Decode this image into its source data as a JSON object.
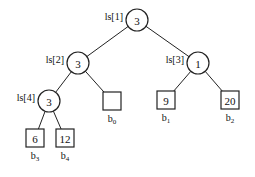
{
  "diagram": {
    "type": "loser-tree",
    "internal_nodes": [
      {
        "id": "n1",
        "label": "ls[1]",
        "value": "3"
      },
      {
        "id": "n2",
        "label": "ls[2]",
        "value": "3"
      },
      {
        "id": "n3",
        "label": "ls[3]",
        "value": "1"
      },
      {
        "id": "n4",
        "label": "ls[4]",
        "value": "3"
      }
    ],
    "leaves": [
      {
        "id": "b0",
        "value": "",
        "label": "b",
        "sub": "0"
      },
      {
        "id": "b1",
        "value": "9",
        "label": "b",
        "sub": "1"
      },
      {
        "id": "b2",
        "value": "20",
        "label": "b",
        "sub": "2"
      },
      {
        "id": "b3",
        "value": "6",
        "label": "b",
        "sub": "3"
      },
      {
        "id": "b4",
        "value": "12",
        "label": "b",
        "sub": "4"
      }
    ],
    "edges": [
      [
        "n1",
        "n2"
      ],
      [
        "n1",
        "n3"
      ],
      [
        "n2",
        "n4"
      ],
      [
        "n2",
        "b0"
      ],
      [
        "n3",
        "b1"
      ],
      [
        "n3",
        "b2"
      ],
      [
        "n4",
        "b3"
      ],
      [
        "n4",
        "b4"
      ]
    ]
  }
}
